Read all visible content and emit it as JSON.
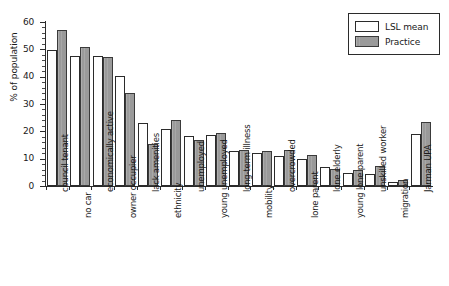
{
  "chart_data": {
    "type": "bar",
    "title": "",
    "subtitle": "",
    "xlabel": "",
    "ylabel": "% of population",
    "ylim": [
      0,
      60
    ],
    "y_ticks": [
      0,
      10,
      20,
      30,
      40,
      50,
      60
    ],
    "y_minor_tick_step": 2,
    "grid": false,
    "legend_position": "top-right",
    "orientation": "vertical",
    "x_tick_label_rotation": -90,
    "categories": [
      "council tenant",
      "no car",
      "economically active",
      "owner occupier",
      "lack amenities",
      "ethnicity",
      "unemployed",
      "young unemployed",
      "long-term illness",
      "mobility",
      "overcrowded",
      "lone parent",
      "lone elderly",
      "young lone parent",
      "unskilled worker",
      "migration",
      "Jarman UPA"
    ],
    "series": [
      {
        "name": "LSL mean",
        "color": "#ffffff",
        "edge_color": "#2b2b2b",
        "values": [
          49.8,
          47.5,
          47.6,
          40.2,
          22.9,
          20.9,
          18.4,
          18.5,
          12.9,
          12.2,
          11.0,
          9.9,
          6.8,
          4.8,
          4.4,
          1.6,
          18.9
        ]
      },
      {
        "name": "Practice",
        "color": "#9a9a9a",
        "edge_color": "#3a3a3a",
        "values": [
          56.9,
          50.8,
          47.2,
          34.0,
          15.5,
          24.3,
          17.0,
          19.4,
          13.3,
          12.9,
          13.0,
          11.3,
          6.4,
          6.0,
          7.2,
          2.2,
          23.3
        ]
      }
    ]
  },
  "legend": {
    "items": [
      {
        "label": "LSL mean",
        "swatch": "lsl"
      },
      {
        "label": "Practice",
        "swatch": "practice"
      }
    ]
  },
  "axis": {
    "y_title": "% of population"
  }
}
